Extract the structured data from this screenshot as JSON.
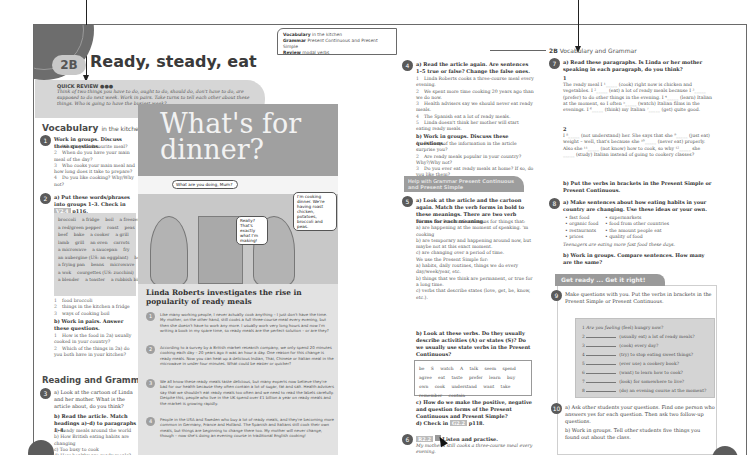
{
  "header": {
    "unit": "2B",
    "title": "Ready, steady, eat",
    "breadcrumb_unit": "2B",
    "breadcrumb_label": "Vocabulary and Grammar"
  },
  "quick_review": {
    "title": "QUICK REVIEW ●●●",
    "text": "Think of two things you have to do, ought to do, should do, don't have to do, are supposed to do next week. Work in pairs. Take turns to tell each other about these things. Who is going to have the busiest week?"
  },
  "info_box": {
    "vocab_label": "Vocabulary",
    "vocab_value": "in the kitchen",
    "grammar_label": "Grammar",
    "grammar_value": "Present Continuous and Present Simple",
    "review_label": "Review",
    "review_value": "modal verbs"
  },
  "vocabulary": {
    "heading": "Vocabulary",
    "subheading": "in the kitchen",
    "ex1": {
      "num": "1",
      "instruction": "Work in groups. Discuss these questions.",
      "items": [
        "What's your favourite meal?",
        "When do you have your main meal of the day?",
        "Who cooks your main meal and how long does it take to prepare?",
        "Do you like cooking? Why/Why not?"
      ]
    },
    "ex2": {
      "num": "2",
      "instruction": "a) Put these words/phrases into groups 1–3. Check in",
      "ref": "V2.4",
      "page": "p116.",
      "words": [
        [
          "broccoli",
          "a fridge",
          "boil",
          "a freezer"
        ],
        [
          "a red/green pepper",
          "roast",
          "peas"
        ],
        [
          "beef",
          "bake",
          "a cooker",
          "a grill"
        ],
        [
          "lamb",
          "grill",
          "an oven",
          "carrots"
        ],
        [
          "a microwave",
          "a saucepan",
          "fry"
        ],
        [
          "an aubergine (US: an eggplant)",
          "heat up"
        ],
        [
          "a frying pan",
          "beans",
          "microwave"
        ],
        [
          "a wok",
          "courgettes (US: zucchini)",
          "steam"
        ],
        [
          "a blender",
          "a toaster",
          "a rubbish bin"
        ]
      ],
      "groups": [
        "food broccoli",
        "things in the kitchen a fridge",
        "ways of cooking boil"
      ],
      "b_instruction": "b) Work in pairs. Answer these questions.",
      "b_items": [
        "How is the food in 2a) usually cooked in your country?",
        "Which of the things in 2a) do you both have in your kitchen?"
      ]
    }
  },
  "reading": {
    "heading": "Reading and Grammar",
    "ex3": {
      "num": "3",
      "a": "a) Look at the cartoon of Linda and her mother. What is the article about, do you think?",
      "b": "b) Read the article. Match headings a)–d) to paragraphs 1–4.",
      "headings": [
        "a) Ready meals around the world",
        "b) How British eating habits are changing",
        "c) Too busy to cook",
        "d) How healthy are ready meals?"
      ]
    }
  },
  "article": {
    "title_line1": "What's for",
    "title_line2": "dinner?",
    "bubble1": "What are you doing, Mum?",
    "bubble2": "Really? That's exactly what I'm making!",
    "bubble3": "I'm cooking dinner. We're having roast chicken, potatoes, broccoli and peas.",
    "subtitle": "Linda Roberts investigates the rise in popularity of ready meals",
    "paragraphs": [
      {
        "n": "1",
        "text": "Like many working people, I never actually cook anything – I just don't have the time. My mother, on the other hand, still cooks a full three-course meal every evening, but then she doesn't have to work any more. I usually work very long hours and now I'm writing a book in my spare time, so ready meals are the perfect solution – or are they?"
      },
      {
        "n": "2",
        "text": "According to a survey by a British market research company, we only spend 20 minutes cooking each day – 20 years ago it was an hour a day. One reason for this change is ready meals. Now you can heat up a delicious Indian, Thai, Chinese or Italian meal in the microwave in under four minutes. What could be easier or quicker?"
      },
      {
        "n": "3",
        "text": "We all know these ready meals taste delicious, but many experts now believe they're bad for our health because they often contain a lot of sugar, fat and salt. Health advisers say that we shouldn't eat ready meals too often and we need to read the labels carefully. Despite this, people who live in the UK spend over £1 billion a year on ready meals and the market is growing rapidly."
      },
      {
        "n": "4",
        "text": "People in the USA and Sweden who buy a lot of ready meals, and they're becoming more common in Germany, France and Holland. The Spanish and Italians still cook their own meals, but things are beginning to change there too. My mother will never change, though – now she's doing an evening course in traditional English cooking!"
      }
    ]
  },
  "ex4": {
    "num": "4",
    "a": "a) Read the article again. Are sentences 1–5 true or false? Change the false ones.",
    "items": [
      "Linda Roberts cooks a three-course meal every evening.",
      "We spent more time cooking 20 years ago than we do now.",
      "Health advisers say we should never eat ready meals.",
      "The Spanish eat a lot of ready meals.",
      "Linda doesn't think her mother will start eating ready meals."
    ],
    "b": "b) Work in groups. Discuss these questions.",
    "b_items": [
      "Did any of the information in the article surprise you?",
      "Are ready meals popular in your country? Why?/Why not?",
      "Do you ever eat ready meals at home? If so, do you like them?"
    ]
  },
  "help_grammar": {
    "label": "Help with Grammar",
    "topic": "Present Continuous and Present Simple"
  },
  "ex5": {
    "num": "5",
    "a": "a) Look at the article and the cartoon again. Match the verb forms in bold to these meanings. There are two verb forms for each meaning.",
    "pc_intro": "We use the Present Continuous for things that:",
    "pc_items": [
      "a) are happening at the moment of speaking. 'm cooking",
      "b) are temporary and happening around now, but maybe not at this exact moment.",
      "c) are changing over a period of time."
    ],
    "ps_intro": "We use the Present Simple for:",
    "ps_items": [
      "a) habits, daily routines, things we do every day/week/year, etc.",
      "b) things that we think are permanent, or true for a long time.",
      "c) verbs that describe states (love, get, be, know, etc.)."
    ],
    "b": "b) Look at these verbs. Do they usually describe activities (A) or states (S)? Do we usually use state verbs in the Present Continuous?",
    "verbs": "be S  watch A  talk  seem  spend  agree  eat  taste  prefer  learn  buy  own  cook  understand  want  take  remember  contain",
    "c": "c) How do we make the positive, negative and question forms of the Present Continuous and Present Simple?",
    "d": "d) Check in",
    "d_ref": "G2.2",
    "d_page": "p118."
  },
  "ex6": {
    "num": "6",
    "ref": "R2.2",
    "label": "Listen and practise.",
    "example": "My mother's still cooks a three-course meal every evening."
  },
  "ex7": {
    "num": "7",
    "a": "a) Read these paragraphs. Is Linda or her mother speaking in each paragraph, do you think?",
    "p1_num": "1",
    "p1": "The ready meal I ¹_____ (cook) right now is chicken and vegetables. I ²_____ (eat) a lot of ready meals because I ³_____ (prefer) to do other things in the evening. I ⁴_____ (learn) Italian at the moment, so I often ⁵_____ (watch) Italian films in the evenings. I ⁶_____ (think) my Italian ⁷_____ (get) quite good.",
    "p2_num": "2",
    "p2": "I ⁸_____ (not understand) her. She says that she ⁹_____ (just eat) weight – well, that's because she ¹⁰_____ (never eat) properly. Also she ¹¹_____ (not know) how to cook, so why ¹²_____ she _____ (study) Italian instead of going to cookery classes?",
    "b": "b) Put the verbs in brackets in the Present Simple or Present Continuous."
  },
  "ex8": {
    "num": "8",
    "a": "a) Make sentences about how eating habits in your country are changing. Use these ideas or your own.",
    "ideas_left": [
      "fast food",
      "organic food",
      "restaurants",
      "prices"
    ],
    "ideas_right": [
      "supermarkets",
      "food from other countries",
      "the amount people eat",
      "quality of food"
    ],
    "example": "Teenagers are eating more fast food these days.",
    "b": "b) Work in groups. Compare sentences. How many are the same?"
  },
  "get_ready": {
    "label": "Get ready ... Get it right!"
  },
  "ex9": {
    "num": "9",
    "instruction": "Make questions with you. Put the verbs in brackets in the Present Simple or Present Continuous.",
    "questions": [
      {
        "n": "1",
        "prefix": "Are you feeling",
        "text": "(feel) hungry now?"
      },
      {
        "n": "2",
        "prefix": "",
        "text": "(usually eat) a lot of ready meals?"
      },
      {
        "n": "3",
        "prefix": "",
        "text": "(cook) every day?"
      },
      {
        "n": "4",
        "prefix": "",
        "text": "(try) to stop eating sweet things?"
      },
      {
        "n": "5",
        "prefix": "",
        "text": "(ever use) a cookery book?"
      },
      {
        "n": "6",
        "prefix": "",
        "text": "(want) to learn how to cook?"
      },
      {
        "n": "7",
        "prefix": "",
        "text": "(look) for somewhere to live?"
      },
      {
        "n": "8",
        "prefix": "",
        "text": "(do) an evening course at the moment?"
      }
    ]
  },
  "ex10": {
    "num": "10",
    "a": "a) Ask other students your questions. Find one person who answers yes for each question. Then ask two follow-up questions.",
    "b": "b) Work in groups. Tell other students five things you found out about the class."
  }
}
